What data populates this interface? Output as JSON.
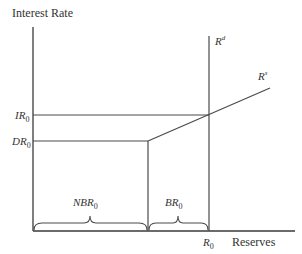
{
  "diagram": {
    "y_axis_label": "Interest Rate",
    "x_axis_label": "Reserves",
    "demand_curve": {
      "base": "R",
      "sup": "d"
    },
    "supply_curve": {
      "base": "R",
      "sup": "s"
    },
    "ir_label": {
      "base": "IR",
      "sub": "0"
    },
    "dr_label": {
      "base": "DR",
      "sub": "0"
    },
    "r0_label": {
      "base": "R",
      "sub": "0"
    },
    "nbr_label": {
      "base": "NBR",
      "sub": "0"
    },
    "br_label": {
      "base": "BR",
      "sub": "0"
    },
    "colors": {
      "line": "#4a4a4a",
      "text": "#333333",
      "background": "#ffffff"
    }
  }
}
